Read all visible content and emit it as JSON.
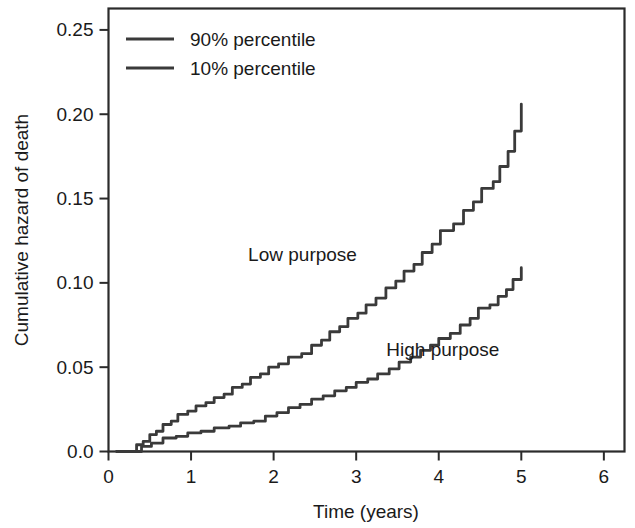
{
  "chart_data": {
    "type": "line",
    "title": "",
    "xlabel": "Time (years)",
    "ylabel": "Cumulative hazard of death",
    "xlim": [
      0,
      6.25
    ],
    "ylim": [
      0,
      0.2627
    ],
    "grid": false,
    "xticks": [
      "0",
      "1",
      "2",
      "3",
      "4",
      "5",
      "6"
    ],
    "xtick_values": [
      0,
      1,
      2,
      3,
      4,
      5,
      6
    ],
    "yticks": [
      "0.0",
      "0.05",
      "0.10",
      "0.15",
      "0.20",
      "0.25"
    ],
    "ytick_values": [
      0.0,
      0.05,
      0.1,
      0.15,
      0.2,
      0.25
    ],
    "legend_position": "top-left",
    "legend": [
      "90% percentile",
      "10% percentile"
    ],
    "annotations": [
      {
        "text": "Low purpose",
        "x": 2.35,
        "y": 0.113
      },
      {
        "text": "High purpose",
        "x": 4.05,
        "y": 0.0565
      }
    ],
    "series": [
      {
        "name": "90% percentile",
        "label": "Low purpose",
        "color": "#3a3a3a",
        "points": [
          [
            0.1,
            0.0
          ],
          [
            0.28,
            0.0
          ],
          [
            0.34,
            0.004
          ],
          [
            0.42,
            0.006
          ],
          [
            0.5,
            0.01
          ],
          [
            0.58,
            0.012
          ],
          [
            0.66,
            0.016
          ],
          [
            0.76,
            0.018
          ],
          [
            0.84,
            0.022
          ],
          [
            0.96,
            0.024
          ],
          [
            1.06,
            0.027
          ],
          [
            1.18,
            0.029
          ],
          [
            1.28,
            0.032
          ],
          [
            1.4,
            0.034
          ],
          [
            1.5,
            0.038
          ],
          [
            1.62,
            0.04
          ],
          [
            1.72,
            0.044
          ],
          [
            1.84,
            0.046
          ],
          [
            1.94,
            0.05
          ],
          [
            2.06,
            0.052
          ],
          [
            2.18,
            0.056
          ],
          [
            2.34,
            0.058
          ],
          [
            2.46,
            0.063
          ],
          [
            2.58,
            0.066
          ],
          [
            2.68,
            0.071
          ],
          [
            2.8,
            0.074
          ],
          [
            2.9,
            0.079
          ],
          [
            3.02,
            0.082
          ],
          [
            3.12,
            0.087
          ],
          [
            3.24,
            0.091
          ],
          [
            3.36,
            0.097
          ],
          [
            3.48,
            0.101
          ],
          [
            3.58,
            0.107
          ],
          [
            3.7,
            0.111
          ],
          [
            3.8,
            0.118
          ],
          [
            3.92,
            0.123
          ],
          [
            4.02,
            0.131
          ],
          [
            4.18,
            0.135
          ],
          [
            4.3,
            0.143
          ],
          [
            4.42,
            0.148
          ],
          [
            4.52,
            0.156
          ],
          [
            4.66,
            0.16
          ],
          [
            4.74,
            0.169
          ],
          [
            4.84,
            0.178
          ],
          [
            4.92,
            0.19
          ],
          [
            5.0,
            0.206
          ]
        ]
      },
      {
        "name": "10% percentile",
        "label": "High purpose",
        "color": "#3a3a3a",
        "points": [
          [
            0.1,
            0.0
          ],
          [
            0.3,
            0.0
          ],
          [
            0.4,
            0.003
          ],
          [
            0.52,
            0.005
          ],
          [
            0.66,
            0.008
          ],
          [
            0.82,
            0.009
          ],
          [
            0.96,
            0.011
          ],
          [
            1.12,
            0.012
          ],
          [
            1.28,
            0.014
          ],
          [
            1.46,
            0.015
          ],
          [
            1.6,
            0.017
          ],
          [
            1.76,
            0.018
          ],
          [
            1.9,
            0.021
          ],
          [
            2.04,
            0.023
          ],
          [
            2.18,
            0.026
          ],
          [
            2.32,
            0.028
          ],
          [
            2.46,
            0.031
          ],
          [
            2.6,
            0.033
          ],
          [
            2.74,
            0.036
          ],
          [
            2.88,
            0.038
          ],
          [
            3.0,
            0.041
          ],
          [
            3.14,
            0.043
          ],
          [
            3.26,
            0.046
          ],
          [
            3.4,
            0.049
          ],
          [
            3.52,
            0.053
          ],
          [
            3.66,
            0.056
          ],
          [
            3.78,
            0.06
          ],
          [
            3.9,
            0.063
          ],
          [
            4.0,
            0.067
          ],
          [
            4.14,
            0.07
          ],
          [
            4.26,
            0.075
          ],
          [
            4.38,
            0.079
          ],
          [
            4.48,
            0.085
          ],
          [
            4.62,
            0.087
          ],
          [
            4.72,
            0.092
          ],
          [
            4.82,
            0.096
          ],
          [
            4.9,
            0.102
          ],
          [
            5.0,
            0.109
          ]
        ]
      }
    ]
  }
}
